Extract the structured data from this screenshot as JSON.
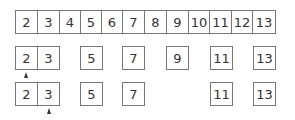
{
  "diagram": {
    "title": "",
    "rows": [
      {
        "name": "full-list",
        "top": 10,
        "cells": [
          {
            "value": "2",
            "left": 15,
            "width": 23
          },
          {
            "value": "3",
            "left": 37,
            "width": 23
          },
          {
            "value": "4",
            "left": 59,
            "width": 22
          },
          {
            "value": "5",
            "left": 80,
            "width": 22
          },
          {
            "value": "6",
            "left": 101,
            "width": 22
          },
          {
            "value": "7",
            "left": 122,
            "width": 23
          },
          {
            "value": "8",
            "left": 144,
            "width": 23
          },
          {
            "value": "9",
            "left": 166,
            "width": 23
          },
          {
            "value": "10",
            "left": 188,
            "width": 22
          },
          {
            "value": "11",
            "left": 209,
            "width": 23
          },
          {
            "value": "12",
            "left": 231,
            "width": 22
          },
          {
            "value": "13",
            "left": 252,
            "width": 24
          }
        ],
        "arrow": null
      },
      {
        "name": "after-removing-multiples-of-2",
        "top": 46,
        "cells": [
          {
            "value": "2",
            "left": 15,
            "width": 23
          },
          {
            "value": "3",
            "left": 37,
            "width": 23
          },
          {
            "value": "5",
            "left": 80,
            "width": 23
          },
          {
            "value": "7",
            "left": 122,
            "width": 23
          },
          {
            "value": "9",
            "left": 166,
            "width": 23
          },
          {
            "value": "11",
            "left": 210,
            "width": 23
          },
          {
            "value": "13",
            "left": 253,
            "width": 23
          }
        ],
        "arrow": {
          "left": 24,
          "top": 72,
          "points_to": "2"
        }
      },
      {
        "name": "after-removing-multiples-of-3",
        "top": 82,
        "cells": [
          {
            "value": "2",
            "left": 15,
            "width": 23
          },
          {
            "value": "3",
            "left": 37,
            "width": 23
          },
          {
            "value": "5",
            "left": 80,
            "width": 23
          },
          {
            "value": "7",
            "left": 122,
            "width": 23
          },
          {
            "value": "11",
            "left": 210,
            "width": 23
          },
          {
            "value": "13",
            "left": 253,
            "width": 23
          }
        ],
        "arrow": {
          "left": 47,
          "top": 108,
          "points_to": "3"
        }
      }
    ]
  }
}
